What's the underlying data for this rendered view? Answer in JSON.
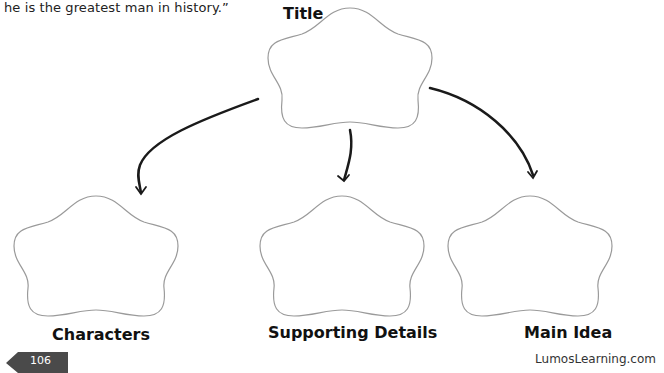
{
  "intro_text": "he is the greatest man in history.”",
  "diagram": {
    "title_label": "Title",
    "nodes": [
      {
        "id": "characters",
        "label": "Characters"
      },
      {
        "id": "supporting_details",
        "label": "Supporting Details"
      },
      {
        "id": "main_idea",
        "label": "Main Idea"
      }
    ]
  },
  "footer": {
    "page_number": "106",
    "site": "LumosLearning.com"
  },
  "colors": {
    "outline": "#9a9a9a",
    "arrow": "#1a1a1a",
    "page_tab": "#4a4a4a"
  }
}
